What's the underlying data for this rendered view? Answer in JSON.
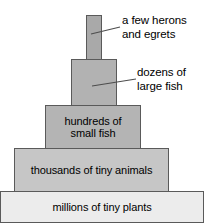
{
  "diagram": {
    "background_color": "#ffffff",
    "outline_color": "#5a5a5a",
    "text_color": "#000000",
    "tiers": [
      {
        "id": "herons",
        "label": "",
        "level": 5,
        "fill": "#a9a9a9",
        "has_inner_label": false
      },
      {
        "id": "large-fish",
        "label": "",
        "level": 4,
        "fill": "#b2b2b2",
        "has_inner_label": false
      },
      {
        "id": "small-fish",
        "label": "hundreds of\nsmall fish",
        "level": 3,
        "fill": "#b4b4b4",
        "has_inner_label": true
      },
      {
        "id": "tiny-animals",
        "label": "thousands of tiny animals",
        "level": 2,
        "fill": "#c6c6c6",
        "has_inner_label": true
      },
      {
        "id": "tiny-plants",
        "label": "millions of tiny plants",
        "level": 1,
        "fill": "#ececec",
        "has_inner_label": true
      }
    ],
    "annotations": [
      {
        "id": "herons",
        "text": "a few herons\nand egrets",
        "points_to": "herons"
      },
      {
        "id": "large-fish",
        "text": "dozens of\nlarge fish",
        "points_to": "large-fish"
      }
    ]
  }
}
